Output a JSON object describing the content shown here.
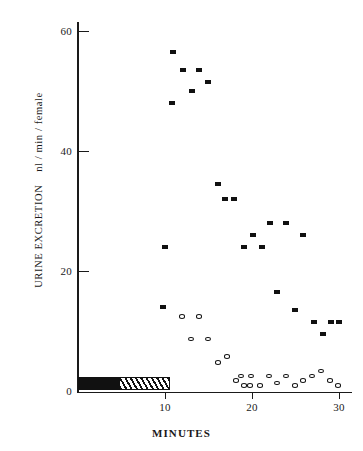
{
  "chart_data": {
    "type": "scatter",
    "title": "",
    "xlabel": "MINUTES",
    "ylabel": "URINE EXCRETION    nl / min / female",
    "ylabel_main": "URINE EXCRETION",
    "ylabel_units": "nl / min / female",
    "xlim": [
      0,
      32
    ],
    "ylim": [
      0,
      62
    ],
    "xticks": [
      10,
      20,
      30
    ],
    "xtick_labels": [
      "10",
      "20",
      "30"
    ],
    "yticks": [
      0,
      20,
      40,
      60
    ],
    "ytick_labels": [
      "0",
      "20",
      "40",
      "60"
    ],
    "grid": false,
    "legend": null,
    "annotations": [
      {
        "name": "treatment-bar-solid",
        "kind": "horizontal-bar",
        "fill": "solid-black",
        "x_start": 0.0,
        "x_end": 4.8,
        "y": 1.2
      },
      {
        "name": "treatment-bar-hatched",
        "kind": "horizontal-bar",
        "fill": "diagonal-hatch",
        "x_start": 4.8,
        "x_end": 10.6,
        "y": 1.2
      }
    ],
    "series": [
      {
        "name": "filled-squares",
        "marker": "filled-square",
        "color": "#111111",
        "points": [
          [
            9.8,
            14.0
          ],
          [
            10.0,
            24.0
          ],
          [
            10.8,
            48.0
          ],
          [
            11.0,
            56.5
          ],
          [
            12.1,
            53.5
          ],
          [
            14.0,
            53.5
          ],
          [
            13.2,
            50.0
          ],
          [
            15.0,
            51.5
          ],
          [
            16.1,
            34.5
          ],
          [
            17.0,
            32.0
          ],
          [
            18.0,
            32.0
          ],
          [
            19.2,
            24.0
          ],
          [
            20.2,
            26.0
          ],
          [
            21.2,
            24.0
          ],
          [
            22.1,
            28.0
          ],
          [
            24.0,
            28.0
          ],
          [
            26.0,
            26.0
          ],
          [
            23.0,
            16.5
          ],
          [
            25.0,
            13.5
          ],
          [
            27.2,
            11.5
          ],
          [
            28.3,
            9.5
          ],
          [
            29.2,
            11.5
          ],
          [
            30.1,
            11.5
          ]
        ]
      },
      {
        "name": "open-circles",
        "marker": "open-circle",
        "color": "#111111",
        "points": [
          [
            12.0,
            12.5
          ],
          [
            14.0,
            12.5
          ],
          [
            13.0,
            8.7
          ],
          [
            15.0,
            8.7
          ],
          [
            16.2,
            4.8
          ],
          [
            17.2,
            5.8
          ],
          [
            18.2,
            1.8
          ],
          [
            19.1,
            1.0
          ],
          [
            20.0,
            2.6
          ],
          [
            21.0,
            1.0
          ],
          [
            18.8,
            2.6
          ],
          [
            19.8,
            1.0
          ],
          [
            22.0,
            2.6
          ],
          [
            23.0,
            1.4
          ],
          [
            24.0,
            2.6
          ],
          [
            25.0,
            1.0
          ],
          [
            26.0,
            1.8
          ],
          [
            27.0,
            2.6
          ],
          [
            28.0,
            3.4
          ],
          [
            29.0,
            1.8
          ],
          [
            30.0,
            1.0
          ]
        ]
      }
    ]
  },
  "axes": {
    "y_axis_name": "y-axis",
    "x_axis_name": "x-axis"
  }
}
